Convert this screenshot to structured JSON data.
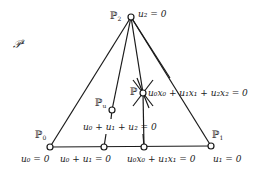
{
  "space_label": {
    "base": "𝒫",
    "exp": "2"
  },
  "points": {
    "P0": {
      "base": "ℙ",
      "sub": "0"
    },
    "P1": {
      "base": "ℙ",
      "sub": "1"
    },
    "P2": {
      "base": "ℙ",
      "sub": "2"
    },
    "Pu": {
      "base": "ℙ",
      "sub": "u"
    },
    "P": {
      "base": "ℙ"
    }
  },
  "labels": {
    "u2": "u₂ = 0",
    "line_eq": "u₀x₀ + u₁x₁ + u₂x₂ = 0",
    "sum_eq": "u₀ + u₁ + u₂ = 0",
    "u0": "u₀ = 0",
    "u0u1": "u₀ + u₁ = 0",
    "u0x0u1x1": "u₀x₀ + u₁x₁ = 0",
    "u1": "u₁ = 0"
  },
  "colors": {
    "ink": "#1a1a1a",
    "background": "#ffffff"
  }
}
